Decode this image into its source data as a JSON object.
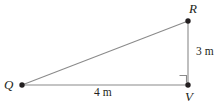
{
  "figure": {
    "type": "right-triangle-diagram",
    "stroke_color": "#8a8a8a",
    "point_color": "#231f20",
    "text_color": "#231f20",
    "background": "#ffffff",
    "vertices": [
      {
        "id": "R",
        "label": "R",
        "x": 188,
        "y": 21
      },
      {
        "id": "Q",
        "label": "Q",
        "x": 22,
        "y": 85
      },
      {
        "id": "V",
        "label": "V",
        "x": 188,
        "y": 85
      }
    ],
    "sides": [
      {
        "id": "QV",
        "from": "Q",
        "to": "V",
        "measure": "4 m"
      },
      {
        "id": "VR",
        "from": "V",
        "to": "R",
        "measure": "3 m"
      },
      {
        "id": "QR",
        "from": "Q",
        "to": "R",
        "measure": ""
      }
    ],
    "right_angle": {
      "at": "V",
      "marker": "square"
    },
    "labels": {
      "vertex_r": "R",
      "vertex_q": "Q",
      "vertex_v": "V",
      "leg_vertical": "3 m",
      "leg_horizontal": "4 m"
    }
  }
}
